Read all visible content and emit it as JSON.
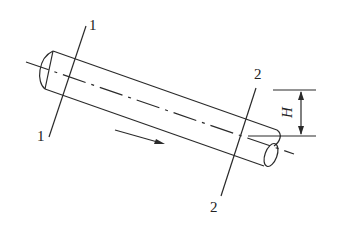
{
  "diagram": {
    "type": "inclined-pipe-flow",
    "sections": [
      {
        "id": "section-1",
        "label_top": "1",
        "label_bottom": "1"
      },
      {
        "id": "section-2",
        "label_top": "2",
        "label_bottom": "2"
      }
    ],
    "dimension": {
      "label": "H"
    },
    "flow_arrow": {
      "direction": "down-right"
    }
  }
}
